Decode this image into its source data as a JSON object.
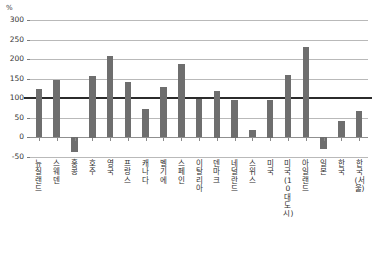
{
  "chart_data": {
    "type": "bar",
    "title": "",
    "subtitle": "",
    "xlabel": "",
    "ylabel": "",
    "unit_label": "%",
    "ylim": [
      -50,
      300
    ],
    "ytick_step": 50,
    "yticks": [
      300,
      250,
      200,
      150,
      100,
      50,
      0,
      -50
    ],
    "ytick_labels": [
      "300",
      "250",
      "200",
      "150",
      "100",
      "50",
      "0",
      "-50"
    ],
    "grid": true,
    "legend": "none",
    "reference_line": 100,
    "bar_color": "#6e6e6e",
    "gridline_color": "#b9b9b9",
    "reference_line_color": "#2b2b2b",
    "categories": [
      "뉴질랜드",
      "스웨덴",
      "홍콩",
      "호주",
      "영국",
      "프랑스",
      "캐나다",
      "벨기에",
      "스페인",
      "이탈리아",
      "덴마크",
      "네덜란드",
      "스위스",
      "미국",
      "미국(10대 도시)",
      "아일랜드",
      "일본",
      "한국",
      "한국(서울)"
    ],
    "values": [
      123,
      148,
      -37,
      157,
      208,
      141,
      73,
      129,
      187,
      98,
      120,
      97,
      20,
      97,
      160,
      232,
      -30,
      42,
      68
    ]
  }
}
